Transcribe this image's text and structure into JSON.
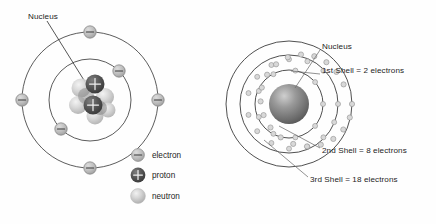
{
  "figure": {
    "title_left": "Bohr model atom with nucleus and two electron shells",
    "title_right": "Atom with three electron shells"
  },
  "left_diagram": {
    "callout": {
      "label": "Nucleus",
      "label_x": 28,
      "label_y": 16,
      "line_from_x": 47,
      "line_from_y": 21,
      "line_to_x": 87,
      "line_to_y": 85
    },
    "center": {
      "x": 90,
      "y": 100
    },
    "shells": [
      {
        "name": "inner-shell",
        "radius": 41
      },
      {
        "name": "outer-shell",
        "radius": 68
      }
    ],
    "electrons": [
      {
        "shell": 2,
        "angle_deg": 270,
        "x": 90,
        "y": 32
      },
      {
        "shell": 2,
        "angle_deg": 0,
        "x": 158,
        "y": 100
      },
      {
        "shell": 2,
        "angle_deg": 90,
        "x": 90,
        "y": 168
      },
      {
        "shell": 2,
        "angle_deg": 180,
        "x": 22,
        "y": 100
      },
      {
        "shell": 1,
        "angle_deg": 315,
        "x": 119,
        "y": 71
      },
      {
        "shell": 1,
        "angle_deg": 135,
        "x": 61,
        "y": 129
      }
    ],
    "nucleus": {
      "protons": [
        {
          "x": 95,
          "y": 84,
          "r": 9.5
        },
        {
          "x": 93,
          "y": 105,
          "r": 9.5
        }
      ],
      "neutrons": [
        {
          "x": 81,
          "y": 88,
          "r": 9.5
        },
        {
          "x": 105,
          "y": 97,
          "r": 9.0
        },
        {
          "x": 78,
          "y": 105,
          "r": 9.0
        },
        {
          "x": 95,
          "y": 116,
          "r": 8.5
        },
        {
          "x": 108,
          "y": 110,
          "r": 7.5
        }
      ]
    }
  },
  "legend": {
    "x": 133,
    "items": [
      {
        "icon": "electron-icon",
        "label": "electron",
        "y": 155,
        "symbol": "minus",
        "fill": "#b9b9b9"
      },
      {
        "icon": "proton-icon",
        "label": "proton",
        "y": 175,
        "symbol": "plus",
        "fill": "#4a4a4a"
      },
      {
        "icon": "neutron-icon",
        "label": "neutron",
        "y": 196,
        "symbol": "none",
        "fill": "#cfcfcf"
      }
    ]
  },
  "right_diagram": {
    "center": {
      "x": 289,
      "y": 104
    },
    "nucleus_radius": 20,
    "shells": [
      {
        "name": "1st-shell",
        "radius": 34,
        "electron_count": 9
      },
      {
        "name": "2nd-shell",
        "radius": 49,
        "electron_count": 13
      },
      {
        "name": "3rd-shell",
        "radius": 63,
        "electron_count": 17
      }
    ],
    "labels": [
      {
        "name": "nucleus-label",
        "text": "Nucleus",
        "x": 322,
        "y": 47,
        "leader_from_x": 320,
        "leader_from_y": 50,
        "leader_to_x": 295,
        "leader_to_y": 88
      },
      {
        "name": "first-shell-label",
        "text": "1st Shell = 2 electrons",
        "x": 322,
        "y": 71,
        "leader_from_x": 320,
        "leader_from_y": 74,
        "leader_to_x": 290,
        "leader_to_y": 72
      },
      {
        "name": "second-shell-label",
        "text": "2nd Shell = 8 electrons",
        "x": 322,
        "y": 151,
        "leader_from_x": 320,
        "leader_from_y": 148,
        "leader_to_x": 279,
        "leader_to_y": 126
      },
      {
        "name": "third-shell-label",
        "text": "3rd Shell = 18 electrons",
        "x": 310,
        "y": 180,
        "leader_from_x": 308,
        "leader_from_y": 177,
        "leader_to_x": 268,
        "leader_to_y": 142
      }
    ]
  },
  "colors": {
    "background": "#fefefe",
    "orbit_stroke": "#4a4a4a",
    "text": "#1d1d1d",
    "electron_fill": "#b9b9b9",
    "proton_fill": "#4a4a4a",
    "neutron_fill": "#cfcfcf",
    "leader": "#6e6e6e"
  }
}
